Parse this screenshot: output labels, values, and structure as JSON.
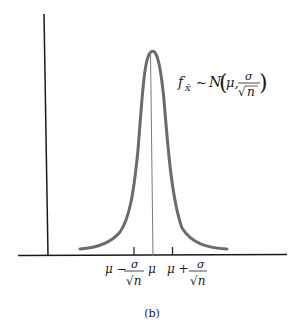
{
  "figure": {
    "caption": "(b)",
    "distribution_label": {
      "lhs": "f",
      "subscript": "X̄",
      "tilde": "~",
      "N": "N",
      "mu_arg": "μ,",
      "numerator": "σ",
      "denominator_root": "√",
      "denominator_var": "n"
    },
    "x_axis_ticks": [
      {
        "label_prefix": "μ −",
        "numerator": "σ",
        "denominator": "√n",
        "position": "mu_minus_se"
      },
      {
        "label": "μ",
        "position": "mu"
      },
      {
        "label_prefix": "μ +",
        "numerator": "σ",
        "denominator": "√n",
        "position": "mu_plus_se"
      }
    ],
    "colors": {
      "axis": "#1a1a1a",
      "curve": "#6b6b6b",
      "center_line": "#7a7a7a"
    }
  }
}
